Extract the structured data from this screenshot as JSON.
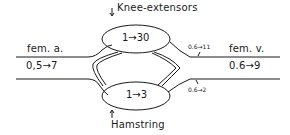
{
  "diagram": {
    "muscles": {
      "top": {
        "name": "Knee-extensors",
        "ratio": "1→30"
      },
      "bottom": {
        "name": "Hamstring",
        "ratio": "1→3"
      }
    },
    "inflow": {
      "vessel": "fem. a.",
      "ratio": "0,5→7"
    },
    "outflow": {
      "vessel": "fem. v.",
      "ratio": "0.6→9"
    },
    "branches": {
      "top_out": "0.6→11",
      "bottom_out": "0.6→2"
    },
    "colors": {
      "stroke": "#1a1a1a",
      "background": "#ffffff"
    }
  }
}
